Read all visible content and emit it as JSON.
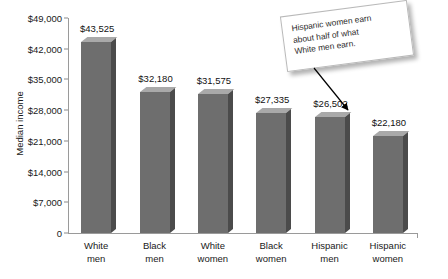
{
  "chart_data": {
    "type": "bar",
    "title": "",
    "xlabel": "",
    "ylabel": "Median income",
    "categories": [
      "White men",
      "Black men",
      "White women",
      "Black women",
      "Hispanic men",
      "Hispanic women"
    ],
    "category_lines": [
      [
        "White",
        "men"
      ],
      [
        "Black",
        "men"
      ],
      [
        "White",
        "women"
      ],
      [
        "Black",
        "women"
      ],
      [
        "Hispanic",
        "men"
      ],
      [
        "Hispanic",
        "women"
      ]
    ],
    "values": [
      43525,
      32180,
      31575,
      27335,
      26502,
      22180
    ],
    "value_labels": [
      "$43,525",
      "$32,180",
      "$31,575",
      "$27,335",
      "$26,502",
      "$22,180"
    ],
    "ylim": [
      0,
      49000
    ],
    "ytick_values": [
      0,
      7000,
      14000,
      21000,
      28000,
      35000,
      42000,
      49000
    ],
    "ytick_labels": [
      "0",
      "$7,000",
      "$14,000",
      "$21,000",
      "$28,000",
      "$35,000",
      "$42,000",
      "$49,000"
    ],
    "grid": false,
    "legend": false,
    "bar_style": "3d",
    "colors": {
      "bar_front": "#6e6e6e",
      "bar_top": "#a9a9a9",
      "bar_side": "#4b4b4b",
      "axis": "#9a9a9a",
      "text": "#1a1a1a",
      "callout_background": "#ffffff",
      "callout_border": "#b9b9b9",
      "arrow": "#000000"
    },
    "annotations": [
      {
        "name": "callout",
        "lines": [
          "Hispanic women earn",
          "about half of what",
          "White men earn."
        ],
        "points_to": "Hispanic women"
      }
    ]
  }
}
